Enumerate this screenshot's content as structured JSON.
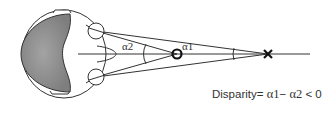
{
  "diagram": {
    "labels": {
      "alpha2": "α2",
      "alpha1": "α1"
    },
    "formula": {
      "prefix": "Disparity= ",
      "a1": "α1",
      "minus": "− ",
      "a2": "α2",
      "relation": " < 0"
    },
    "elements": {
      "head": "head-top-view",
      "left_eye": "eye",
      "right_eye": "eye",
      "fixation_point": "circle-marker",
      "target_point": "x-marker"
    },
    "colors": {
      "brain_fill": "#8c8c8c",
      "line": "#222222",
      "background": "#ffffff"
    }
  }
}
